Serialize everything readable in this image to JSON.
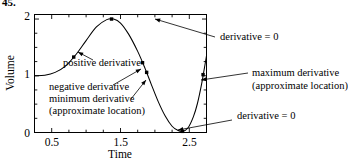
{
  "problem_number": "45.",
  "axes": {
    "y_label": "Volume",
    "x_label": "Time",
    "y_ticks": [
      "0",
      "1",
      "2"
    ],
    "y_tick_values": [
      0,
      1,
      2
    ],
    "x_ticks": [
      "0.5",
      "1.5",
      "2.5"
    ],
    "x_tick_values": [
      0.5,
      1.5,
      2.5
    ],
    "x_range": [
      0.25,
      2.75
    ],
    "y_range": [
      0,
      2.08
    ],
    "x_minor_step": 0.25,
    "y_minor_step": 0.25,
    "box": true,
    "grid": false
  },
  "annotations": [
    {
      "id": "positive-derivative",
      "text": "positive derivative",
      "text_x": 63,
      "text_y": 66,
      "anchor": "start",
      "point": [
        75,
        50
      ],
      "arrow_from": [
        93,
        60
      ],
      "arrow_to": [
        78,
        52
      ]
    },
    {
      "id": "negative-derivative",
      "text": "negative derivative",
      "text_x": 49,
      "text_y": 90,
      "anchor": "start",
      "point": [
        144,
        68
      ],
      "arrow_from": [
        113,
        85
      ],
      "arrow_to": [
        141,
        69
      ]
    },
    {
      "id": "minimum-derivative",
      "text": "minimum derivative",
      "text_x": 49,
      "text_y": 102,
      "anchor": "start",
      "point": [
        148,
        78
      ],
      "arrow_from": [
        131,
        99
      ],
      "arrow_to": [
        146,
        80
      ]
    },
    {
      "id": "minimum-derivative-sub",
      "text": "(approximate location)",
      "text_x": 49,
      "text_y": 114,
      "anchor": "start"
    },
    {
      "id": "derivative-zero-top",
      "text": "derivative = 0",
      "text_x": 220,
      "text_y": 40,
      "anchor": "start",
      "point": [
        152,
        18
      ],
      "arrow_from": [
        215,
        37
      ],
      "arrow_to": [
        155,
        19
      ]
    },
    {
      "id": "maximum-derivative",
      "text": "maximum derivative",
      "text_x": 252,
      "text_y": 76,
      "anchor": "start",
      "point": [
        198,
        80
      ],
      "arrow_from": [
        248,
        73
      ],
      "arrow_to": [
        201,
        80
      ]
    },
    {
      "id": "maximum-derivative-sub",
      "text": "(approximate location)",
      "text_x": 252,
      "text_y": 89,
      "anchor": "start"
    },
    {
      "id": "derivative-zero-bottom",
      "text": "derivative = 0",
      "text_x": 237,
      "text_y": 119,
      "anchor": "start",
      "point": [
        175,
        130
      ],
      "arrow_from": [
        232,
        120
      ],
      "arrow_to": [
        178,
        130
      ]
    }
  ],
  "chart_data": {
    "type": "line",
    "title": "",
    "xlabel": "Time",
    "ylabel": "Volume",
    "xlim": [
      0.25,
      2.75
    ],
    "ylim": [
      0,
      2.08
    ],
    "xticks": [
      0.5,
      1.5,
      2.5
    ],
    "yticks": [
      0,
      1,
      2
    ],
    "grid": false,
    "legend": false,
    "series": [
      {
        "name": "volume",
        "x": [
          0.25,
          0.4,
          0.55,
          0.7,
          0.85,
          1.0,
          1.15,
          1.3,
          1.4,
          1.5,
          1.62,
          1.75,
          1.85,
          1.95,
          2.05,
          2.15,
          2.25,
          2.33,
          2.4,
          2.48,
          2.56,
          2.62,
          2.68,
          2.72,
          2.75
        ],
        "y": [
          1.0,
          1.01,
          1.06,
          1.17,
          1.37,
          1.62,
          1.86,
          1.99,
          2.0,
          1.93,
          1.73,
          1.43,
          1.15,
          0.84,
          0.54,
          0.29,
          0.11,
          0.04,
          0.02,
          0.08,
          0.28,
          0.52,
          0.86,
          1.14,
          1.35
        ]
      }
    ],
    "markers": [
      {
        "label": "positive derivative point",
        "x": 0.82,
        "y": 1.33
      },
      {
        "label": "curve maximum / derivative = 0",
        "x": 1.37,
        "y": 2.0
      },
      {
        "label": "negative derivative point",
        "x": 1.82,
        "y": 1.23
      },
      {
        "label": "minimum derivative point",
        "x": 1.88,
        "y": 1.06
      },
      {
        "label": "curve minimum / derivative = 0",
        "x": 2.4,
        "y": 0.02
      },
      {
        "label": "maximum derivative point",
        "x": 2.7,
        "y": 1.02
      }
    ]
  }
}
